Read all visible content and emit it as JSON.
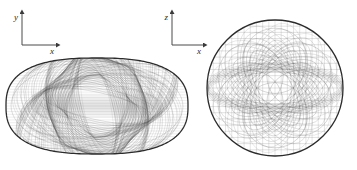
{
  "figure": {
    "title": "",
    "background_color": "#ffffff",
    "ink_color": "#555555",
    "outline_color": "#2b2b2b",
    "axis_color": "#4a4a4a",
    "panels": [
      {
        "name": "side-view-panel",
        "axes": {
          "vertical_label": "y",
          "horizontal_label": "x",
          "origin_x": 22,
          "origin_y": 45,
          "vertical_tip_y": 12,
          "horizontal_tip_x": 58
        },
        "shape": {
          "kind": "oblate-ellipse",
          "center_x": 97,
          "center_y": 106,
          "semi_axis_x": 91,
          "semi_axis_y": 48,
          "superellipse_exponent": 2.6,
          "curve_count": 120
        }
      },
      {
        "name": "end-view-panel",
        "axes": {
          "vertical_label": "z",
          "horizontal_label": "x",
          "origin_x": 172,
          "origin_y": 45,
          "vertical_tip_y": 12,
          "horizontal_tip_x": 205
        },
        "shape": {
          "kind": "sphere-mesh",
          "center_x": 275,
          "center_y": 88,
          "radius": 68,
          "grid_rows": 22,
          "grid_cols": 22,
          "petal_count": 6
        }
      }
    ]
  },
  "chart_data": {
    "type": "line",
    "xlabel": "x",
    "ylabel": "y / z",
    "series": [
      {
        "name": "side-view-envelope",
        "projection_plane": "x-y",
        "outline": "oblate superellipse",
        "semi_axis_x": 91,
        "semi_axis_y": 48,
        "aspect_ratio": 1.9
      },
      {
        "name": "end-view-envelope",
        "projection_plane": "x-z",
        "outline": "circle",
        "radius": 68,
        "aspect_ratio": 1.0
      }
    ],
    "grid": false,
    "legend_position": "none",
    "annotations": [
      "y",
      "x",
      "z",
      "x"
    ]
  }
}
